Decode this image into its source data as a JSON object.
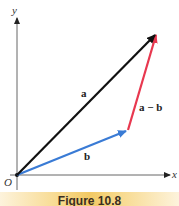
{
  "figure": {
    "caption": "Figure 10.8",
    "axes": {
      "x_label": "x",
      "y_label": "y",
      "origin_label": "O"
    },
    "vectors": [
      {
        "id": "a",
        "label": "a",
        "color": "#111111",
        "tail": "O",
        "tail_xy": [
          0,
          0
        ],
        "head_xy": [
          6,
          5
        ]
      },
      {
        "id": "b",
        "label": "b",
        "color": "#3a7bd5",
        "tail": "O",
        "tail_xy": [
          0,
          0
        ],
        "head_xy": [
          5.25,
          1.65
        ]
      },
      {
        "id": "a_minus_b",
        "label": "a − b",
        "color": "#e8384f",
        "tail_xy": [
          5.25,
          1.65
        ],
        "head_xy": [
          6,
          5
        ]
      }
    ]
  }
}
